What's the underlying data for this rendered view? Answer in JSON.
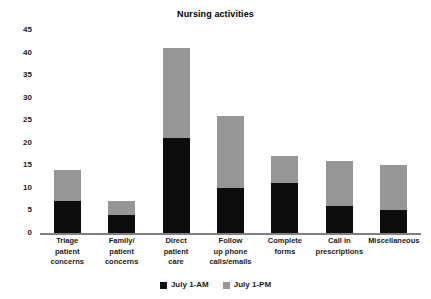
{
  "chart_data": {
    "type": "bar",
    "subtype": "stacked-vertical",
    "title": "Nursing activities",
    "xlabel": "",
    "ylabel": "",
    "ylim": [
      0,
      45
    ],
    "yticks": [
      0,
      5,
      10,
      15,
      20,
      25,
      30,
      35,
      40,
      45
    ],
    "ytick_labels": [
      "0",
      "5",
      "10",
      "15",
      "20",
      "25",
      "30",
      "35",
      "40",
      "45"
    ],
    "grid": false,
    "legend_position": "bottom-center",
    "categories": [
      "Triage\npatient\nconcerns",
      "Family/\npatient\nconcerns",
      "Direct\npatient\ncare",
      "Follow\nup phone\ncalls/emails",
      "Complete\nforms",
      "Call in\nprescriptions",
      "Miscellaneous"
    ],
    "series": [
      {
        "name": "July 1-AM",
        "color": "#0d0d0d",
        "values": [
          7,
          4,
          21,
          10,
          11,
          6,
          5
        ]
      },
      {
        "name": "July 1-PM",
        "color": "#969696",
        "values": [
          7,
          3,
          20,
          16,
          6,
          10,
          10
        ]
      }
    ],
    "totals": [
      14,
      7,
      41,
      26,
      17,
      16,
      15
    ]
  },
  "legend": {
    "items": [
      {
        "label": "July 1-AM",
        "swatch": "am"
      },
      {
        "label": "July 1-PM",
        "swatch": "pm"
      }
    ]
  },
  "colors": {
    "am_series": "#0d0d0d",
    "pm_series": "#969696",
    "axis": "#808080",
    "text": "#1a1a1a",
    "background": "#ffffff"
  }
}
